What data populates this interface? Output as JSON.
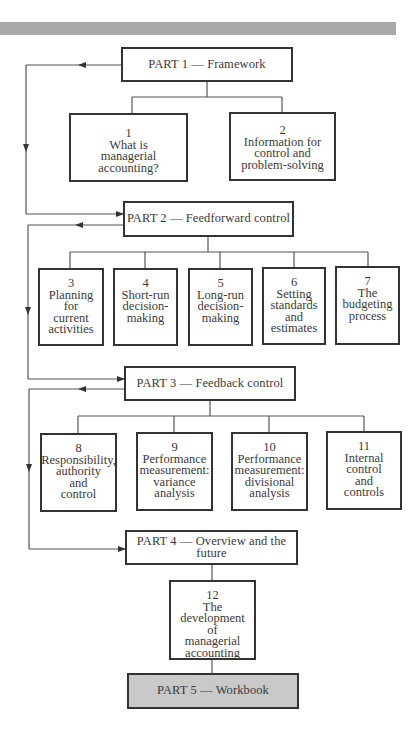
{
  "parts": [
    {
      "id": "part1",
      "label": "PART 1 — Framework"
    },
    {
      "id": "part2",
      "label": "PART 2 — Feedforward control"
    },
    {
      "id": "part3",
      "label": "PART 3 — Feedback control"
    },
    {
      "id": "part4",
      "label": "PART 4 — Overview and the future"
    },
    {
      "id": "part5",
      "label": "PART 5 — Workbook"
    }
  ],
  "chapters": [
    {
      "number": "1",
      "lines": [
        "What is",
        "managerial accounting?"
      ]
    },
    {
      "number": "2",
      "lines": [
        "Information for",
        "control and",
        "problem-solving"
      ]
    },
    {
      "number": "3",
      "lines": [
        "Planning",
        "for",
        "current",
        "activities"
      ]
    },
    {
      "number": "4",
      "lines": [
        "Short-run",
        "decision-",
        "making"
      ]
    },
    {
      "number": "5",
      "lines": [
        "Long-run",
        "decision-",
        "making"
      ]
    },
    {
      "number": "6",
      "lines": [
        "Setting",
        "standards",
        "and",
        "estimates"
      ]
    },
    {
      "number": "7",
      "lines": [
        "The",
        "budgeting",
        "process"
      ]
    },
    {
      "number": "8",
      "lines": [
        "Responsibility,",
        "authority",
        "and",
        "control"
      ]
    },
    {
      "number": "9",
      "lines": [
        "Performance",
        "measurement:",
        "variance",
        "analysis"
      ]
    },
    {
      "number": "10",
      "lines": [
        "Performance",
        "measurement:",
        "divisional",
        "analysis"
      ]
    },
    {
      "number": "11",
      "lines": [
        "Internal",
        "control",
        "and",
        "controls"
      ]
    },
    {
      "number": "12",
      "lines": [
        "The development",
        "of",
        "managerial",
        "accounting"
      ]
    }
  ],
  "colors": {
    "band": "#a9a9a9",
    "border": "#333333",
    "part5_fill": "#c9c9c9"
  }
}
